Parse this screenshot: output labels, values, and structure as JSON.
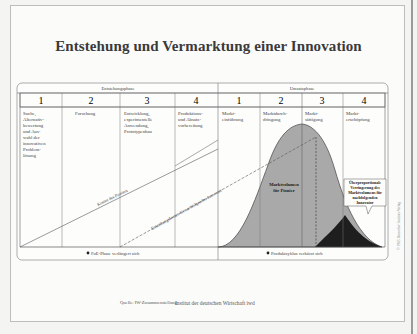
{
  "title": "Entstehung und Vermarktung einer Innovation",
  "phases": [
    {
      "label": "Entstehungsphase",
      "steps": [
        {
          "number": "1",
          "lines": [
            "Suche,",
            "Alternativ-",
            "bewertung",
            "und Aus-",
            "wahl der",
            "innovativen",
            "Problem-",
            "lösung"
          ]
        },
        {
          "number": "2",
          "lines": [
            "Forschung"
          ]
        },
        {
          "number": "3",
          "lines": [
            "Entwicklung,",
            "experimentelle",
            "Anwendung,",
            "Prototypenbau"
          ]
        },
        {
          "number": "4",
          "lines": [
            "Produktions-",
            "und Absatz-",
            "vorbereitung"
          ]
        }
      ],
      "footnote": "FuE-Phase verlängert sich"
    },
    {
      "label": "Umsatzphase",
      "steps": [
        {
          "number": "1",
          "lines": [
            "Markt-",
            "einführung"
          ]
        },
        {
          "number": "2",
          "lines": [
            "Marktdurch-",
            "dringung"
          ]
        },
        {
          "number": "3",
          "lines": [
            "Markt-",
            "sättigung"
          ]
        },
        {
          "number": "4",
          "lines": [
            "Markt-",
            "erschöpfung"
          ]
        }
      ],
      "footnote": "Produktzyklus verkürzt sich"
    }
  ],
  "annotations": {
    "pioneer_cost_line": "Kosten des Pioniers",
    "follower_cost_line": "Entstehungskosten für nachfolgenden Innovator",
    "pioneer_volume": [
      "Marktvolumen",
      "für Pionier"
    ],
    "callout": [
      "Überproportionale",
      "Verringerung des",
      "Marktvolumens für",
      "nachfolgenden",
      "Innovator"
    ]
  },
  "colors": {
    "curve_fill": "#a9a9a9",
    "follower_fill": "#1e1e1e",
    "line": "#555555"
  },
  "footer": {
    "source": "Quelle: IW-Zusammenstellung",
    "institute": "Institut der deutschen Wirtschaft iwd"
  },
  "side_note": "© 1983 Deutscher Instituts-Verlag"
}
